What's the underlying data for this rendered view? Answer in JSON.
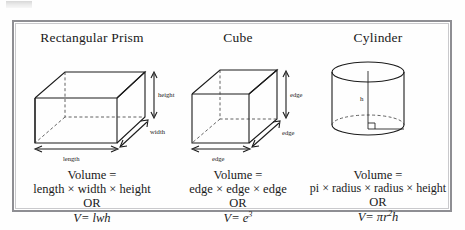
{
  "page": {
    "background": "#fefefe",
    "frame_color": "#8e8e93"
  },
  "panels": [
    {
      "id": "rectangular-prism",
      "heading": "Rectangular Prism",
      "figure": {
        "shape": "rectangular-prism",
        "labels": [
          "height",
          "width",
          "length"
        ]
      },
      "formula": {
        "line1": "Volume =",
        "line2": "length × width × height",
        "line3": "OR",
        "symbolic": "V= lwh"
      }
    },
    {
      "id": "cube",
      "heading": "Cube",
      "figure": {
        "shape": "cube",
        "labels": [
          "edge",
          "edge",
          "edge"
        ]
      },
      "formula": {
        "line1": "Volume =",
        "line2": "edge × edge × edge",
        "line3": "OR",
        "symbolic_base": "V= e",
        "symbolic_exp": "3"
      }
    },
    {
      "id": "cylinder",
      "heading": "Cylinder",
      "figure": {
        "shape": "cylinder",
        "labels": [
          "h"
        ]
      },
      "formula": {
        "line1": "Volume =",
        "line2": "pi × radius × radius × height",
        "line3": "OR",
        "symbolic_pre": "V= πr",
        "symbolic_exp": "2",
        "symbolic_post": "h"
      }
    }
  ]
}
